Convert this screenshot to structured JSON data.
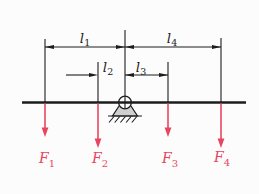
{
  "figure": {
    "colors": {
      "line": "#1c1c1c",
      "force": "#e8465e",
      "support_fill": "#cfcfcf",
      "background": "#fcfcfc"
    }
  },
  "dimensions": [
    {
      "id": "l1",
      "base": "l",
      "sub": "1"
    },
    {
      "id": "l2",
      "base": "l",
      "sub": "2"
    },
    {
      "id": "l3",
      "base": "l",
      "sub": "3"
    },
    {
      "id": "l4",
      "base": "l",
      "sub": "4"
    }
  ],
  "forces": [
    {
      "id": "F1",
      "base": "F",
      "sub": "1"
    },
    {
      "id": "F2",
      "base": "F",
      "sub": "2"
    },
    {
      "id": "F3",
      "base": "F",
      "sub": "3"
    },
    {
      "id": "F4",
      "base": "F",
      "sub": "4"
    }
  ]
}
